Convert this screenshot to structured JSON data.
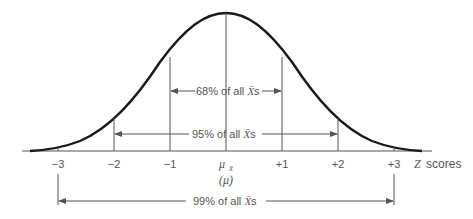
{
  "diagram": {
    "axis": {
      "label_z": "Z",
      "label_scores": "scores",
      "ticks": [
        {
          "label": "−3",
          "x": 58
        },
        {
          "label": "−2",
          "x": 114
        },
        {
          "label": "−1",
          "x": 170
        },
        {
          "label": "",
          "x": 226
        },
        {
          "label": "+1",
          "x": 282
        },
        {
          "label": "+2",
          "x": 338
        },
        {
          "label": "+3",
          "x": 394
        }
      ],
      "mean_symbol": "μ",
      "mean_subscript": "X̄",
      "mean_paren": "(μ)"
    },
    "bands": [
      {
        "id": "68",
        "text_pre": "68% of all ",
        "text_var": "X̄",
        "text_post": "s",
        "from": -1,
        "to": 1
      },
      {
        "id": "95",
        "text_pre": "95% of all ",
        "text_var": "X̄",
        "text_post": "s",
        "from": -2,
        "to": 2
      },
      {
        "id": "99",
        "text_pre": "99% of all ",
        "text_var": "X̄",
        "text_post": "s",
        "from": -3,
        "to": 3
      }
    ],
    "colors": {
      "curve": "#1a1a1a",
      "lines": "#555555",
      "text": "#555555",
      "background": "#ffffff"
    }
  }
}
